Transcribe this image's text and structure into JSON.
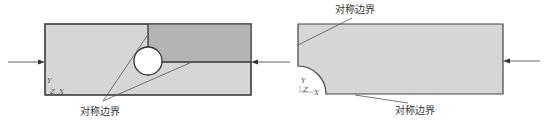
{
  "figure": {
    "colors": {
      "plate_light": "#d6d6d6",
      "plate_dark": "#b4b4b4",
      "outline": "#444444",
      "hole": "#ffffff",
      "leader": "#555555"
    },
    "left_model": {
      "label": "对称边界",
      "axes": {
        "y": "Y",
        "z": "Z",
        "x": "X"
      }
    },
    "right_model": {
      "label_top": "对称边界",
      "label_bottom": "对称边界",
      "axes": {
        "y": "Y",
        "z": "Z",
        "x": "X"
      }
    }
  }
}
